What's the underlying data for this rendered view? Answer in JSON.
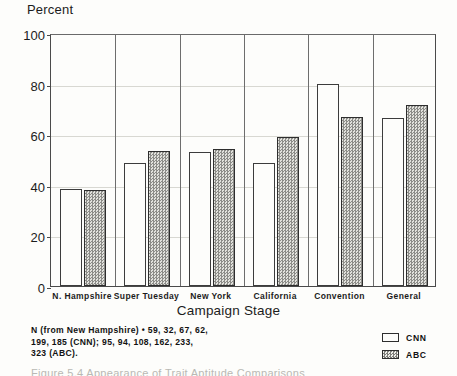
{
  "chart_data": {
    "type": "bar",
    "title": "",
    "ylabel": "Percent",
    "xlabel": "Campaign Stage",
    "ylim": [
      0,
      100
    ],
    "yticks": [
      0,
      20,
      40,
      60,
      80,
      100
    ],
    "grid": true,
    "legend_position": "bottom-right",
    "categories": [
      "N. Hampshire",
      "Super Tuesday",
      "New York",
      "California",
      "Convention",
      "General"
    ],
    "series": [
      {
        "name": "CNN",
        "values": [
          38.5,
          48.5,
          53,
          48.5,
          80,
          66.5
        ]
      },
      {
        "name": "ABC",
        "values": [
          38,
          53.5,
          54,
          59,
          67,
          71.5
        ]
      }
    ],
    "annotations": [
      "N (from New Hampshire) = 59, 32, 67, 62, 199, 185 (CNN); 95, 94, 108, 162, 233, 323 (ABC)."
    ]
  },
  "axes": {
    "y_title": "Percent",
    "x_title": "Campaign Stage",
    "y_ticks": [
      "0",
      "20",
      "40",
      "60",
      "80",
      "100"
    ],
    "x_ticks": [
      "N. Hampshire",
      "Super Tuesday",
      "New York",
      "California",
      "Convention",
      "General"
    ]
  },
  "legend": {
    "items": [
      {
        "label": "CNN",
        "style": "open"
      },
      {
        "label": "ABC",
        "style": "hatched"
      }
    ]
  },
  "footnote": {
    "line1": "N (from New Hampshire) • 59, 32, 67, 62,",
    "line2": "199, 185 (CNN); 95, 94, 108, 162, 233,",
    "line3": "323 (ABC)."
  },
  "caption": {
    "partial_text": "Figure 5.4   Appearance of Trait Aptitude Comparisons"
  },
  "colors": {
    "ink": "#1a1a1a",
    "frame": "#4a4a4a",
    "grid": "#d8d8d2",
    "bar_open": "#fdfdfb",
    "bar_hatched": "#b7b7b2",
    "background": "#fdfdfb"
  }
}
